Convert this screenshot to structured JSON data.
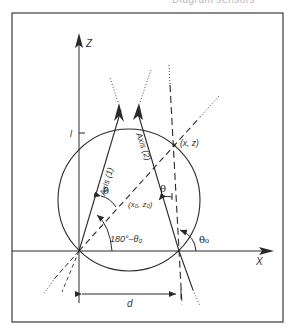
{
  "header": {
    "partial_text": "Diagram sensors"
  },
  "diagram": {
    "axis_z_label": "Z",
    "axis_x_label": "X",
    "tick_label_l": "l",
    "axis1_label": "Axis (1)",
    "axis2_label": "Axis (2)",
    "point_label": "(x, z)",
    "center_label": "(x₀, z₀)",
    "theta_label_1": "θ",
    "theta_label_2": "θ",
    "angle_label": "180°–θ₀",
    "theta0_label": "θ₀",
    "distance_label": "d"
  },
  "colors": {
    "line": "#2a2a2a",
    "frame": "#3a3a3a",
    "background": "#ffffff"
  }
}
